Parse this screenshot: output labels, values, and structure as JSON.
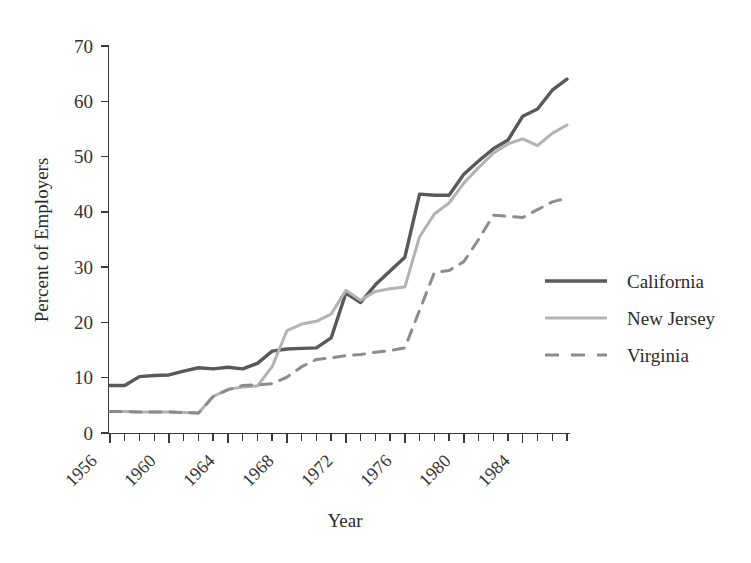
{
  "chart_data": {
    "type": "line",
    "title": "",
    "xlabel": "Year",
    "ylabel": "Percent of Employers",
    "xlim": [
      1956,
      1987
    ],
    "ylim": [
      0,
      70
    ],
    "yticks": [
      0,
      10,
      20,
      30,
      40,
      50,
      60,
      70
    ],
    "xticks_labeled": [
      1956,
      1960,
      1964,
      1968,
      1972,
      1976,
      1980,
      1984
    ],
    "xtick_step_minor": 1,
    "grid": false,
    "legend_position": "right",
    "x": [
      1956,
      1957,
      1958,
      1959,
      1960,
      1961,
      1962,
      1963,
      1964,
      1965,
      1966,
      1967,
      1968,
      1969,
      1970,
      1971,
      1972,
      1973,
      1974,
      1975,
      1976,
      1977,
      1978,
      1979,
      1980,
      1981,
      1982,
      1983,
      1984,
      1985,
      1986,
      1987
    ],
    "series": [
      {
        "name": "California",
        "color": "#595959",
        "style": "solid",
        "width": 3.4,
        "values": [
          8.6,
          8.6,
          10.2,
          10.4,
          10.5,
          11.2,
          11.8,
          11.6,
          11.9,
          11.6,
          12.6,
          14.8,
          15.2,
          15.3,
          15.4,
          17.2,
          25.3,
          23.6,
          26.8,
          29.3,
          31.8,
          43.2,
          43.0,
          43.0,
          46.8,
          49.2,
          51.4,
          53.0,
          57.3,
          58.6,
          62.0,
          64.0
        ]
      },
      {
        "name": "New Jersey",
        "color": "#b3b3b3",
        "style": "solid",
        "width": 3.0,
        "values": [
          3.9,
          3.9,
          3.8,
          3.8,
          3.8,
          3.7,
          3.6,
          6.6,
          7.9,
          8.3,
          8.5,
          12.0,
          18.5,
          19.7,
          20.2,
          21.5,
          25.8,
          24.0,
          25.6,
          26.1,
          26.4,
          35.5,
          39.6,
          41.6,
          45.2,
          48.0,
          50.6,
          52.3,
          53.2,
          52.0,
          54.2,
          55.7
        ]
      },
      {
        "name": "Virginia",
        "color": "#8c8c8c",
        "style": "dashed",
        "width": 3.0,
        "values": [
          3.9,
          3.9,
          3.8,
          3.8,
          3.8,
          3.7,
          3.6,
          6.6,
          7.8,
          8.6,
          8.7,
          8.9,
          10.1,
          12.0,
          13.3,
          13.6,
          14.0,
          14.2,
          14.6,
          14.9,
          15.4,
          22.2,
          29.0,
          29.4,
          31.0,
          35.0,
          39.4,
          39.2,
          39.0,
          40.4,
          41.8,
          42.5
        ]
      }
    ]
  },
  "legend": {
    "items": [
      {
        "label": "California"
      },
      {
        "label": "New Jersey"
      },
      {
        "label": "Virginia"
      }
    ]
  },
  "axes": {
    "y_title": "Percent of Employers",
    "x_title": "Year",
    "y_tick_labels": [
      "0",
      "10",
      "20",
      "30",
      "40",
      "50",
      "60",
      "70"
    ],
    "x_tick_labels": [
      "1956",
      "1960",
      "1964",
      "1968",
      "1972",
      "1976",
      "1980",
      "1984"
    ]
  }
}
